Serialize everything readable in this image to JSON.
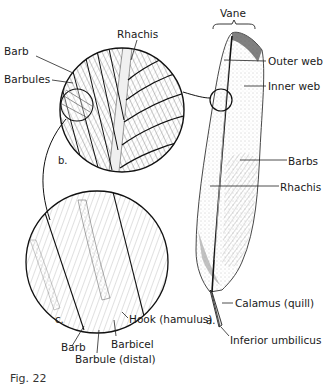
{
  "figure": {
    "panels": {
      "a": "a.",
      "b": "b.",
      "c": "c."
    },
    "labels": {
      "vane": "Vane",
      "rhachis_b": "Rhachis",
      "barb_b": "Barb",
      "barbules_b": "Barbules",
      "outer_web": "Outer web",
      "inner_web": "Inner web",
      "barbs_a": "Barbs",
      "rhachis_a": "Rhachis",
      "calamus": "Calamus (quill)",
      "inferior_umbilicus": "Inferior umbilicus",
      "hook": "Hook (hamulus)",
      "barb_c": "Barb",
      "barbicel": "Barbicel",
      "barbule_distal": "Barbule (distal)"
    },
    "caption": "Fig. 22"
  },
  "colors": {
    "ink": "#1a1a1a",
    "shade": "#9a9a9a",
    "light_shade": "#cfcfcf",
    "background": "#ffffff"
  }
}
